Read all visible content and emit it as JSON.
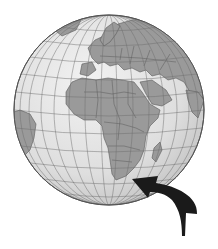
{
  "figure": {
    "highlight_target": "southern-africa",
    "colors": {
      "background": "#ffffff",
      "ocean": "#e4e4e4",
      "land": "#9a9a9a",
      "grid": "#6e6e6e",
      "border": "#5a5a5a",
      "outline": "#555555",
      "arrow": "#1a1a1a"
    }
  }
}
